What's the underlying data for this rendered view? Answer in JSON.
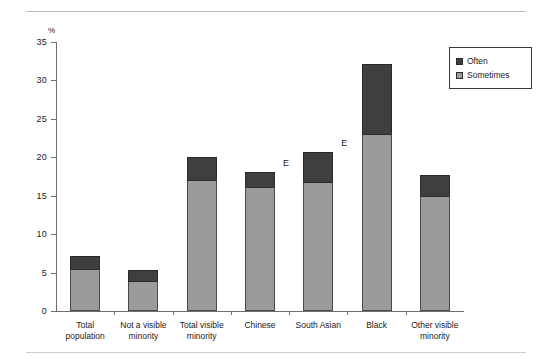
{
  "chart_data": {
    "type": "bar",
    "subtype": "stacked-vertical",
    "title": "",
    "xlabel": "",
    "ylabel": "%",
    "ylim": [
      0,
      35
    ],
    "yticks": [
      0,
      5,
      10,
      15,
      20,
      25,
      30,
      35
    ],
    "grid": false,
    "legend_position": "top-right",
    "categories": [
      "Total population",
      "Not a visible minority",
      "Total visible minority",
      "Chinese",
      "South Asian",
      "Black",
      "Other visible minority"
    ],
    "category_lines": [
      [
        "Total",
        "population"
      ],
      [
        "Not a visible",
        "minority"
      ],
      [
        "Total visible",
        "minority"
      ],
      [
        "Chinese"
      ],
      [
        "South Asian"
      ],
      [
        "Black"
      ],
      [
        "Other visible",
        "minority"
      ]
    ],
    "series": [
      {
        "name": "Sometimes",
        "color": "#9b9b9b",
        "values": [
          5.5,
          3.9,
          17.0,
          16.1,
          16.8,
          23.0,
          14.9
        ]
      },
      {
        "name": "Often",
        "color": "#3f3f3f",
        "values": [
          1.7,
          1.4,
          3.1,
          2.0,
          3.9,
          9.2,
          2.8
        ]
      }
    ],
    "totals": [
      7.2,
      5.3,
      20.1,
      18.1,
      20.7,
      32.2,
      17.7
    ],
    "annotations": [
      {
        "text": "E",
        "category": "Chinese"
      },
      {
        "text": "E",
        "category": "South Asian"
      }
    ]
  },
  "legend": {
    "items": [
      {
        "label": "Often",
        "color": "#3f3f3f"
      },
      {
        "label": "Sometimes",
        "color": "#9b9b9b"
      }
    ]
  },
  "axis": {
    "unit_label": "%",
    "tick_labels": [
      "35",
      "30",
      "25",
      "20",
      "15",
      "10",
      "5",
      "0"
    ]
  }
}
